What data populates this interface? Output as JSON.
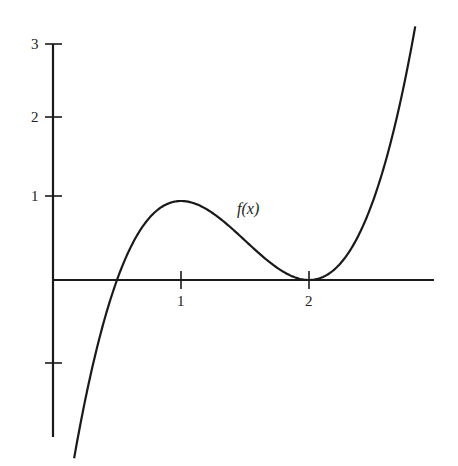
{
  "chart_data": {
    "type": "line",
    "title": "",
    "xlabel": "",
    "ylabel": "",
    "function_label": "f(x)",
    "function": "f(x) = 2(x - 0.5)(x - 2)^2",
    "x_ticks": [
      1,
      2
    ],
    "x_tick_labels": [
      "1",
      "2"
    ],
    "y_ticks": [
      -1,
      1,
      2,
      3
    ],
    "y_tick_labels": [
      "",
      "1",
      "2",
      "3"
    ],
    "xlim": [
      0,
      2.98
    ],
    "ylim": [
      -1.7,
      3.0
    ],
    "grid": false,
    "legend": "none",
    "series": [
      {
        "name": "f(x)",
        "x": [
          0.15,
          0.3,
          0.43,
          0.5,
          0.75,
          1.0,
          1.25,
          1.5,
          1.75,
          2.0,
          2.25,
          2.5,
          2.75,
          2.84
        ],
        "y": [
          -2.42,
          -1.16,
          -0.34,
          0.0,
          0.56,
          1.0,
          0.84,
          0.5,
          0.16,
          0.0,
          0.22,
          1.0,
          2.53,
          3.0
        ]
      }
    ],
    "annotations": [
      {
        "text": "f(x)",
        "x": 1.5,
        "y": 0.95
      }
    ],
    "colors": {
      "curve": "#1a1a1a",
      "axes": "#1a1a1a",
      "background": "#ffffff"
    }
  }
}
